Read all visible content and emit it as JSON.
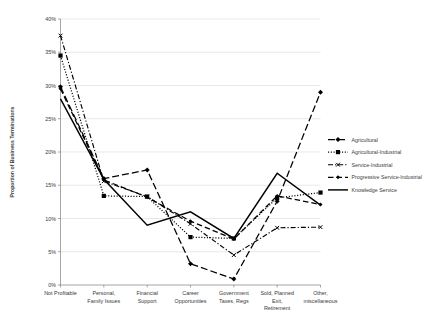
{
  "chart_data": {
    "type": "line",
    "title": "",
    "xlabel": "",
    "ylabel": "Proportion of Business Terminations",
    "ylim": [
      0,
      40
    ],
    "ytick_labels": [
      "0%",
      "5%",
      "10%",
      "15%",
      "20%",
      "25%",
      "30%",
      "35%",
      "40%"
    ],
    "ytick_values": [
      0,
      5,
      10,
      15,
      20,
      25,
      30,
      35,
      40
    ],
    "grid": true,
    "legend_position": "right",
    "categories": [
      "Not Profitable",
      "Personal, Family Issues",
      "Financial Support",
      "Career Opportunities",
      "Government Taxes, Regs",
      "Sold, Planned Exit, Retirement",
      "Other, miscellaneous"
    ],
    "category_lines": [
      [
        "Not Profitable"
      ],
      [
        "Personal,",
        "Family Issues"
      ],
      [
        "Financial",
        "Support"
      ],
      [
        "Career",
        "Opportunities"
      ],
      [
        "Government",
        "Taxes, Regs"
      ],
      [
        "Sold, Planned",
        "Exit,",
        "Retirement"
      ],
      [
        "Other,",
        "miscellaneous"
      ]
    ],
    "series": [
      {
        "name": "Agricultural",
        "style": "dashdot-long",
        "marker": "diamond",
        "values": [
          29.8,
          16.0,
          17.3,
          3.2,
          0.9,
          12.6,
          29.0
        ]
      },
      {
        "name": "Agricultural-Industrial",
        "style": "dotted",
        "marker": "square",
        "values": [
          34.5,
          13.4,
          13.3,
          7.2,
          7.0,
          13.1,
          13.9
        ]
      },
      {
        "name": "Service-Industrial",
        "style": "dashdot-short",
        "marker": "cross",
        "values": [
          37.5,
          15.6,
          13.3,
          9.2,
          4.5,
          8.6,
          8.7
        ]
      },
      {
        "name": "Progressive Service-Industrial",
        "style": "dashed",
        "marker": "diamond-small",
        "values": [
          29.5,
          15.8,
          13.2,
          9.6,
          6.9,
          13.4,
          12.1
        ]
      },
      {
        "name": "Knowledge Service",
        "style": "solid",
        "marker": "none",
        "values": [
          28.0,
          15.9,
          9.0,
          11.0,
          7.0,
          16.8,
          12.0
        ]
      }
    ]
  },
  "legend": {
    "items": [
      {
        "label": "Agricultural"
      },
      {
        "label": "Agricultural-Industrial"
      },
      {
        "label": "Service-Industrial"
      },
      {
        "label": "Progressive Service-Industrial"
      },
      {
        "label": "Knowledge Service"
      }
    ]
  }
}
